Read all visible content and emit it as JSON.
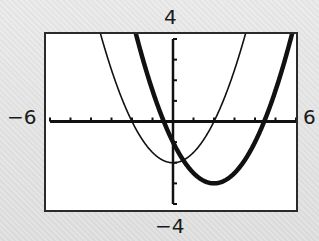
{
  "window": {
    "xmin_label": "−6",
    "xmax_label": "6",
    "ymin_label": "−4",
    "ymax_label": "4"
  },
  "colors": {
    "background": "#e4e4e4",
    "screen": "#ffffff",
    "frame": "#2a2a2a",
    "axis": "#111111",
    "curve": "#111111"
  },
  "chart_data": {
    "type": "line",
    "title": "",
    "xlabel": "",
    "ylabel": "",
    "xlim": [
      -6,
      6
    ],
    "ylim": [
      -4,
      4
    ],
    "xscl": 1,
    "yscl": 1,
    "grid": false,
    "legend": null,
    "tick_labels": {
      "x": [
        "−6",
        "6"
      ],
      "y": [
        "−4",
        "4"
      ]
    },
    "series": [
      {
        "name": "thin-parabola",
        "style": "thin",
        "expression": "y = 0.5x^2 - 2",
        "vertex": [
          0,
          -2
        ],
        "x_intercepts": [
          -2,
          2
        ],
        "x": [
          -3.46,
          -3,
          -2,
          -1,
          0,
          1,
          2,
          3,
          3.46
        ],
        "values": [
          4,
          2.5,
          0,
          -1.5,
          -2,
          -1.5,
          0,
          2.5,
          4
        ]
      },
      {
        "name": "thick-parabola",
        "style": "thick",
        "expression": "y = 0.5(x - 2)^2 - 3",
        "vertex": [
          2,
          -3
        ],
        "x_intercepts": [
          -0.45,
          4.45
        ],
        "x": [
          -1.74,
          -1,
          0,
          1,
          2,
          3,
          4,
          5,
          5.74
        ],
        "values": [
          4,
          1.5,
          -1,
          -2.5,
          -3,
          -2.5,
          -1,
          1.5,
          4
        ]
      }
    ]
  }
}
